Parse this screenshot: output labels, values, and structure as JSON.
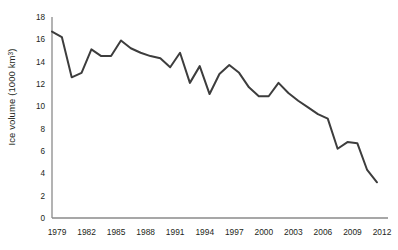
{
  "chart_data": {
    "type": "line",
    "title": "",
    "xlabel": "",
    "ylabel": "Ice volume (1000 km³)",
    "ylabel_text": "Ice volume (1000 km",
    "ylabel_sup": "3",
    "ylabel_tail": ")",
    "xlim": [
      1979,
      2012
    ],
    "ylim": [
      0,
      18
    ],
    "grid": false,
    "legend": null,
    "line_color": "#3d3d3d",
    "axis_color": "#8a8a8a",
    "x": [
      1979,
      1980,
      1981,
      1982,
      1983,
      1984,
      1985,
      1986,
      1987,
      1988,
      1989,
      1990,
      1991,
      1992,
      1993,
      1994,
      1995,
      1996,
      1997,
      1998,
      1999,
      2000,
      2001,
      2002,
      2003,
      2004,
      2005,
      2006,
      2007,
      2008,
      2009,
      2010,
      2011,
      2012
    ],
    "values": [
      16.7,
      16.2,
      12.6,
      13.0,
      15.1,
      14.5,
      14.5,
      15.9,
      15.2,
      14.8,
      14.5,
      14.3,
      13.5,
      14.8,
      12.1,
      13.6,
      11.1,
      12.9,
      13.7,
      13.0,
      11.7,
      10.9,
      10.9,
      12.1,
      11.2,
      10.5,
      9.9,
      9.3,
      8.9,
      6.2,
      6.8,
      6.7,
      4.3,
      3.2
    ],
    "x_tick_labels": [
      "1979",
      "1982",
      "1985",
      "1988",
      "1991",
      "1994",
      "1997",
      "2000",
      "2003",
      "2006",
      "2009",
      "2012"
    ],
    "x_ticks": [
      1979,
      1982,
      1985,
      1988,
      1991,
      1994,
      1997,
      2000,
      2003,
      2006,
      2009,
      2012
    ],
    "y_tick_labels": [
      "0",
      "2",
      "4",
      "6",
      "8",
      "10",
      "12",
      "14",
      "16",
      "18"
    ],
    "y_ticks": [
      0,
      2,
      4,
      6,
      8,
      10,
      12,
      14,
      16,
      18
    ]
  }
}
